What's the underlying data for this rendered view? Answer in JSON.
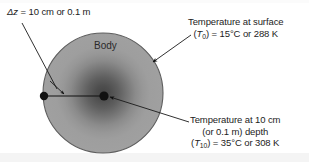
{
  "figure": {
    "background_color": "#ffffff",
    "body": {
      "label": "Body",
      "fill_outer_color": "#9d9d9d",
      "core_color": "#4a4a4a",
      "outline_color": "#5a5a5a",
      "center_x": 103,
      "center_y": 93,
      "radius": 60
    },
    "annotations": {
      "thickness": {
        "symbol": "Δz",
        "equals": " = ",
        "value": "10 cm or 0.1 m",
        "full_text": "Δz = 10 cm or 0.1 m"
      },
      "surface_temperature": {
        "line1": "Temperature at surface",
        "symbol_open": "(",
        "symbol_var": "T",
        "symbol_sub": "0",
        "symbol_close": ")",
        "equals": " = ",
        "value": "15°C or 288 K",
        "line2_full": "(T0) = 15°C or 288 K"
      },
      "depth_temperature": {
        "line1": "Temperature at 10 cm",
        "line2": "(or 0.1 m) depth",
        "symbol_open": "(",
        "symbol_var": "T",
        "symbol_sub": "10",
        "symbol_close": ")",
        "equals": " = ",
        "value": "35°C or 308 K",
        "line3_full": "(T10) = 35°C or 308 K"
      }
    },
    "markers": {
      "surface_point": {
        "x": 44,
        "y": 96,
        "color": "#111111",
        "radius": 4
      },
      "center_point": {
        "x": 104,
        "y": 96,
        "color": "#111111",
        "radius": 4.5
      }
    },
    "leaders": {
      "thickness_leader": {
        "x1": 22,
        "y1": 22,
        "x2": 56,
        "y2": 88
      },
      "thickness_arrow": {
        "x1": 50,
        "y1": 82,
        "x2": 63,
        "y2": 94
      },
      "depth_span_arrow": {
        "x1": 44,
        "y1": 96,
        "x2": 104,
        "y2": 96
      },
      "surface_leader": {
        "x1": 190,
        "y1": 36,
        "x2": 152,
        "y2": 62
      },
      "depth_leader": {
        "x1": 188,
        "y1": 122,
        "x2": 108,
        "y2": 97
      }
    }
  }
}
